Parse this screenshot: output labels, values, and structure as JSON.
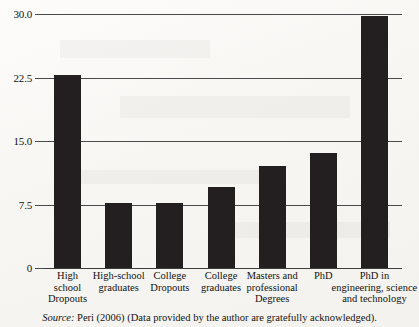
{
  "chart_data": {
    "type": "bar",
    "title": "",
    "xlabel": "",
    "ylabel": "",
    "ylim": [
      0,
      30
    ],
    "grid": true,
    "legend": null,
    "categories": [
      "High school Dropouts",
      "High-school graduates",
      "College Dropouts",
      "College graduates",
      "Masters and professional Degrees",
      "PhD",
      "PhD in engineering, science and technology"
    ],
    "category_lines": [
      [
        "High",
        "school",
        "Dropouts"
      ],
      [
        "High-school",
        "graduates"
      ],
      [
        "College",
        "Dropouts"
      ],
      [
        "College",
        "graduates"
      ],
      [
        "Masters and",
        "professional",
        "Degrees"
      ],
      [
        "PhD"
      ],
      [
        "PhD in",
        "engineering, science",
        "and technology"
      ]
    ],
    "values": [
      22.8,
      7.7,
      7.7,
      9.6,
      12.0,
      13.6,
      29.8
    ],
    "ytick_labels": [
      "30.0",
      "22.5",
      "15.0",
      "7.5",
      "0"
    ],
    "ytick_values": [
      30.0,
      22.5,
      15.0,
      7.5,
      0
    ],
    "bar_color": "#231f20",
    "axis_color": "#4a4a4a",
    "background_color": "#fbfaf8"
  },
  "source_note": {
    "label": "Source:",
    "text": "Peri (2006) (Data provided by the author are gratefully acknowledged)."
  }
}
